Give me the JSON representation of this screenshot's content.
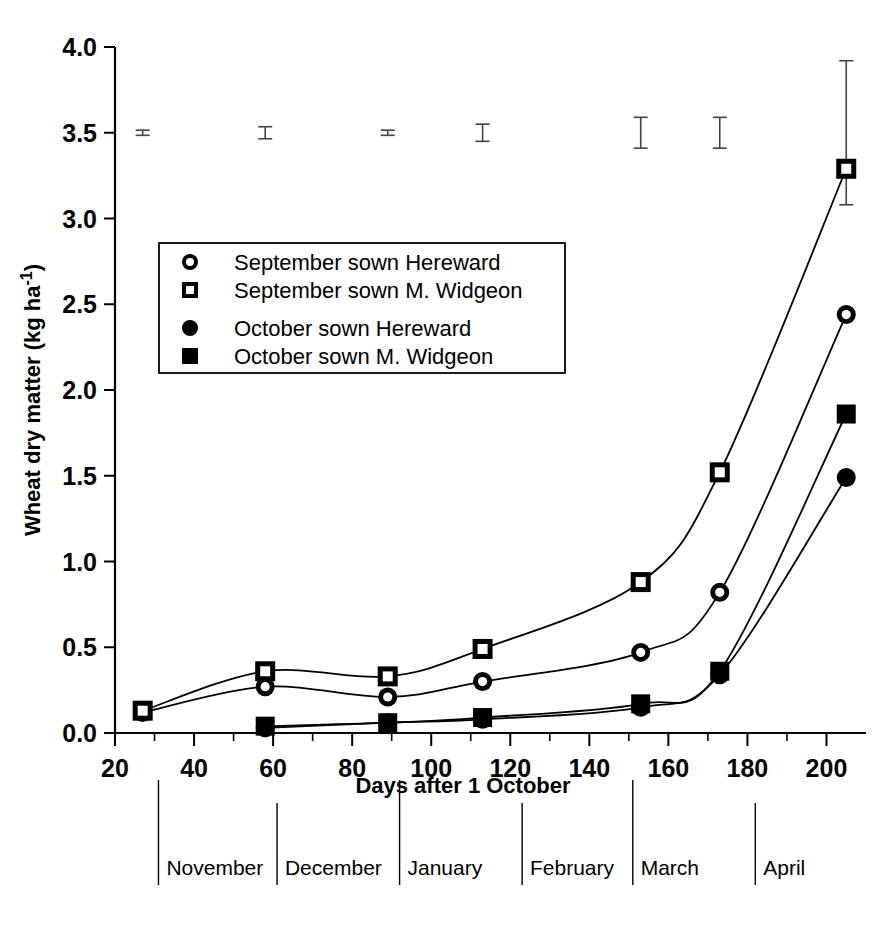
{
  "chart_data": {
    "type": "line",
    "title": "",
    "xlabel": "Days after 1 October",
    "ylabel": "Wheat dry matter (kg ha-1)",
    "ylabel_display": "Wheat dry matter (kg ha",
    "ylabel_sup": "-1",
    "ylabel_tail": ")",
    "xlim": [
      20,
      210
    ],
    "ylim": [
      0.0,
      4.0
    ],
    "grid": false,
    "legend_position": "upper-left-inside",
    "x_ticks": [
      20,
      40,
      60,
      80,
      100,
      120,
      140,
      160,
      180,
      200
    ],
    "x_tick_labels": [
      "20",
      "40",
      "60",
      "80",
      "100",
      "120",
      "140",
      "160",
      "180",
      "200"
    ],
    "x_minor_tick_step": 10,
    "y_ticks": [
      0.0,
      0.5,
      1.0,
      1.5,
      2.0,
      2.5,
      3.0,
      3.5,
      4.0
    ],
    "y_tick_labels": [
      "0.0",
      "0.5",
      "1.0",
      "1.5",
      "2.0",
      "2.5",
      "3.0",
      "3.5",
      "4.0"
    ],
    "x": [
      27,
      58,
      89,
      113,
      153,
      173,
      205
    ],
    "series": [
      {
        "name": "September sown Hereward",
        "marker": "open-circle",
        "values": [
          0.12,
          0.27,
          0.21,
          0.3,
          0.47,
          0.82,
          2.44
        ]
      },
      {
        "name": "September sown M. Widgeon",
        "marker": "open-square",
        "values": [
          0.13,
          0.36,
          0.33,
          0.49,
          0.88,
          1.52,
          3.29
        ]
      },
      {
        "name": "October sown Hereward",
        "marker": "filled-circle",
        "values": [
          null,
          0.03,
          0.06,
          0.08,
          0.15,
          0.34,
          1.49
        ]
      },
      {
        "name": "October sown M. Widgeon",
        "marker": "filled-square",
        "values": [
          null,
          0.04,
          0.06,
          0.09,
          0.17,
          0.36,
          1.86
        ]
      }
    ],
    "error_bars": {
      "description": "SED bars plotted at y = 3.5 for each sampling date",
      "y": 3.5,
      "x": [
        27,
        58,
        89,
        113,
        153,
        173,
        205
      ],
      "half_widths": [
        0.015,
        0.035,
        0.015,
        0.05,
        0.09,
        0.09,
        0.42
      ]
    },
    "month_axis": {
      "labels": [
        "November",
        "December",
        "January",
        "February",
        "March",
        "April"
      ],
      "boundaries_days": [
        31,
        61,
        92,
        123,
        151,
        182,
        212
      ],
      "label_days": [
        33,
        63,
        94,
        125,
        153,
        184
      ]
    },
    "annotations": []
  },
  "legend": {
    "entries": [
      {
        "marker": "open-circle",
        "label": "September sown Hereward"
      },
      {
        "marker": "open-square",
        "label": "September sown M. Widgeon"
      },
      {
        "marker": "filled-circle",
        "label": "October sown Hereward"
      },
      {
        "marker": "filled-square",
        "label": "October sown M. Widgeon"
      }
    ]
  },
  "colors": {
    "ink": "#000000",
    "background": "#ffffff",
    "error_bar": "#444444"
  }
}
